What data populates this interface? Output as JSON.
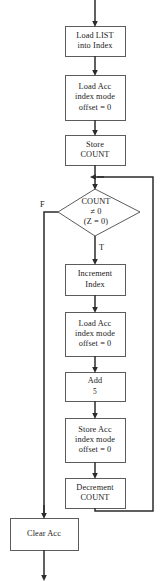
{
  "diagram": {
    "type": "flowchart",
    "stroke_color": "#3a3a3a",
    "text_color": "#1a1a1a",
    "background_color": "#ffffff"
  },
  "nodes": [
    {
      "id": "load-list",
      "shape": "process",
      "lines": [
        "Load LIST",
        "into Index"
      ]
    },
    {
      "id": "load-acc-1",
      "shape": "process",
      "lines": [
        "Load Acc",
        "index mode",
        "offset = 0"
      ]
    },
    {
      "id": "store-count",
      "shape": "process",
      "lines": [
        "Store",
        "COUNT"
      ]
    },
    {
      "id": "count-test",
      "shape": "decision",
      "lines": [
        "COUNT",
        "≠ 0",
        "(Z = 0)"
      ]
    },
    {
      "id": "increment-index",
      "shape": "process",
      "lines": [
        "Increment",
        "Index"
      ]
    },
    {
      "id": "load-acc-2",
      "shape": "process",
      "lines": [
        "Load Acc",
        "index mode",
        "offset = 0"
      ]
    },
    {
      "id": "add-5",
      "shape": "process",
      "lines": [
        "Add",
        "5"
      ]
    },
    {
      "id": "store-acc",
      "shape": "process",
      "lines": [
        "Store Acc",
        "index mode",
        "offset = 0"
      ]
    },
    {
      "id": "decrement-count",
      "shape": "process",
      "lines": [
        "Decrement",
        "COUNT"
      ]
    },
    {
      "id": "clear-acc",
      "shape": "process",
      "lines": [
        "Clear Acc"
      ]
    }
  ],
  "branch_labels": {
    "false": "F",
    "true": "T"
  }
}
